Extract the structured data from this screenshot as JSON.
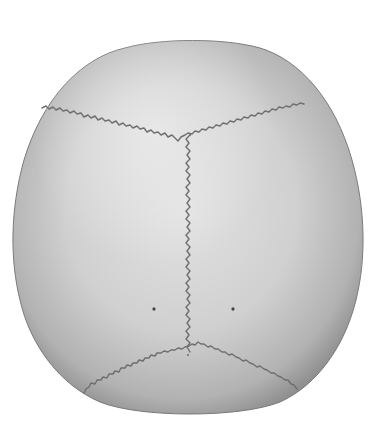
{
  "figure": {
    "background_color": "#ffffff",
    "bone_colors": {
      "center": "#dedede",
      "mid": "#c4c4c4",
      "edge": "#8e8e8e"
    },
    "suture_color": "#6f6f6f",
    "features": [
      {
        "name": "coronal-suture"
      },
      {
        "name": "sagittal-suture"
      },
      {
        "name": "lambdoid-suture"
      },
      {
        "name": "bregma"
      },
      {
        "name": "lambda"
      },
      {
        "name": "parietal-foramen-left"
      },
      {
        "name": "parietal-foramen-right"
      }
    ]
  }
}
